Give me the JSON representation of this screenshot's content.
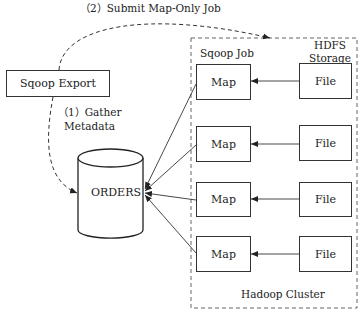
{
  "diagram": {
    "step2_label": "（2）Submit Map-Only Job",
    "step1_label_line1": "（1）Gather",
    "step1_label_line2": "Metadata",
    "sqoop_export": "Sqoop Export",
    "database": "ORDERS",
    "cluster_label": "Hadoop Cluster",
    "sqoop_job_label": "Sqoop Job",
    "hdfs_label_line1": "HDFS",
    "hdfs_label_line2": "Storage",
    "rows": [
      {
        "map": "Map",
        "file": "File"
      },
      {
        "map": "Map",
        "file": "File"
      },
      {
        "map": "Map",
        "file": "File"
      },
      {
        "map": "Map",
        "file": "File"
      }
    ]
  }
}
